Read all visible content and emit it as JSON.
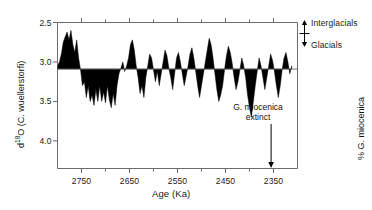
{
  "figure": {
    "axis_left_label_pre": "d",
    "axis_left_label_sup": "18",
    "axis_left_label_post": "O (C. wuellerstorfi)",
    "axis_left_label_full": "d18O (C. wuellerstorfi)",
    "axis_right_label": "% G. miocenica",
    "axis_x_label": "Age (Ka)",
    "annotation_interglacials": "Interglacials",
    "annotation_glacials": "Glacials",
    "annotation_extinct_line1": "G. miocenica",
    "annotation_extinct_line2": "extinct",
    "ink_color": "#000000",
    "axis_color": "#6b6b6b",
    "text_color": "#1a1a1a"
  },
  "chart_data": {
    "type": "area",
    "title": "",
    "xlabel": "Age (Ka)",
    "ylabel": "d18O (C. wuellerstorfi)",
    "y2label": "% G. miocenica",
    "xlim": [
      2800,
      2300
    ],
    "x_reversed": true,
    "xticks": [
      2750,
      2650,
      2550,
      2450,
      2350
    ],
    "xtick_labels": [
      "2750",
      "2650",
      "2550",
      "2450",
      "2350"
    ],
    "x_minor_ticks": [
      2800,
      2700,
      2600,
      2500,
      2400,
      2300
    ],
    "ylim_left": [
      4.35,
      2.5
    ],
    "y_left_inverted": true,
    "yticks_left": [
      2.5,
      3.0,
      3.5,
      4.0
    ],
    "ytick_labels_left": [
      "2.5",
      "3.0",
      "3.5",
      "4.0"
    ],
    "ylim_right": [
      0.0,
      0.47
    ],
    "yticks_right": [
      0.0,
      0.1,
      0.2,
      0.3,
      0.4
    ],
    "ytick_labels_right": [
      "0.0",
      "0.1",
      "0.2",
      "0.3",
      "0.4"
    ],
    "grid": false,
    "legend": "none",
    "annotations": [
      {
        "text": "Interglacials",
        "x": 2290,
        "y_left": 2.75,
        "arrow": "up"
      },
      {
        "text": "Glacials",
        "x": 2290,
        "y_left": 3.45,
        "arrow": "down"
      },
      {
        "text": "G. miocenica extinct",
        "x": 2355,
        "y_right": 0.22,
        "arrow": "down"
      }
    ],
    "series": [
      {
        "name": "d18O (C. wuellerstorfi)",
        "axis": "left",
        "fill_baseline": 3.09,
        "x": [
          2800,
          2796,
          2792,
          2788,
          2784,
          2780,
          2776,
          2772,
          2768,
          2764,
          2760,
          2756,
          2752,
          2748,
          2744,
          2740,
          2736,
          2732,
          2728,
          2724,
          2720,
          2716,
          2712,
          2708,
          2704,
          2700,
          2696,
          2692,
          2688,
          2684,
          2680,
          2676,
          2672,
          2668,
          2664,
          2660,
          2656,
          2652,
          2648,
          2644,
          2640,
          2636,
          2632,
          2628,
          2624,
          2620,
          2616,
          2612,
          2608,
          2604,
          2600,
          2596,
          2592,
          2588,
          2584,
          2580,
          2576,
          2572,
          2568,
          2564,
          2560,
          2556,
          2552,
          2548,
          2544,
          2540,
          2536,
          2532,
          2528,
          2524,
          2520,
          2516,
          2512,
          2508,
          2504,
          2500,
          2496,
          2492,
          2488,
          2484,
          2480,
          2476,
          2472,
          2468,
          2464,
          2460,
          2456,
          2452,
          2448,
          2444,
          2440,
          2436,
          2432,
          2428,
          2424,
          2420,
          2416,
          2412,
          2408,
          2404,
          2400,
          2396,
          2392,
          2388,
          2384,
          2380,
          2376,
          2372,
          2368,
          2364,
          2360,
          2356,
          2352,
          2348,
          2344,
          2340,
          2336,
          2332,
          2328,
          2324,
          2320,
          2316,
          2312
        ],
        "values": [
          3.05,
          3.0,
          2.9,
          2.75,
          2.68,
          2.62,
          2.72,
          2.6,
          2.78,
          2.88,
          2.72,
          2.95,
          3.1,
          3.3,
          3.25,
          3.45,
          3.3,
          3.5,
          3.42,
          3.55,
          3.35,
          3.5,
          3.3,
          3.5,
          3.38,
          3.52,
          3.3,
          3.48,
          3.58,
          3.4,
          3.55,
          3.3,
          3.15,
          3.08,
          3.0,
          3.12,
          3.05,
          2.95,
          2.78,
          2.72,
          2.85,
          3.05,
          3.2,
          3.4,
          3.3,
          3.45,
          3.2,
          3.05,
          2.9,
          2.95,
          3.1,
          3.25,
          3.12,
          3.3,
          3.15,
          3.0,
          2.85,
          2.92,
          3.08,
          3.2,
          3.35,
          3.15,
          2.95,
          2.88,
          3.0,
          3.15,
          3.3,
          3.18,
          3.05,
          2.9,
          2.82,
          2.95,
          3.12,
          3.3,
          3.45,
          3.3,
          3.15,
          3.0,
          2.85,
          2.7,
          2.78,
          2.95,
          3.15,
          3.35,
          3.5,
          3.42,
          3.3,
          3.1,
          2.92,
          2.8,
          2.88,
          3.02,
          3.2,
          3.35,
          3.25,
          3.1,
          2.95,
          3.05,
          3.2,
          3.42,
          3.58,
          3.7,
          3.5,
          3.3,
          3.12,
          2.95,
          3.05,
          3.2,
          3.35,
          3.2,
          3.05,
          2.9,
          2.98,
          3.12,
          3.3,
          3.45,
          3.3,
          3.1,
          2.95,
          2.88,
          3.0,
          3.15,
          3.05
        ]
      },
      {
        "name": "% G. miocenica",
        "axis": "right",
        "fill_baseline": 0.0,
        "x": [
          2800,
          2796,
          2792,
          2788,
          2784,
          2780,
          2776,
          2772,
          2768,
          2764,
          2760,
          2756,
          2752,
          2748,
          2744,
          2740,
          2736,
          2732,
          2728,
          2724,
          2720,
          2716,
          2712,
          2708,
          2704,
          2700,
          2696,
          2692,
          2688,
          2684,
          2680,
          2676,
          2672,
          2668,
          2664,
          2660,
          2656,
          2652,
          2648,
          2644,
          2640,
          2636,
          2632,
          2628,
          2624,
          2620,
          2616,
          2612,
          2608,
          2604,
          2600,
          2596,
          2592,
          2588,
          2584,
          2580,
          2576,
          2572,
          2568,
          2564,
          2560,
          2556,
          2552,
          2548,
          2544,
          2540,
          2536,
          2532,
          2528,
          2524,
          2520,
          2516,
          2512,
          2508,
          2504,
          2500,
          2496,
          2492,
          2488,
          2484,
          2480,
          2476,
          2472,
          2468,
          2464,
          2460,
          2456,
          2452,
          2448,
          2444,
          2440,
          2436,
          2432,
          2428,
          2424,
          2420,
          2416,
          2412,
          2408,
          2404,
          2400,
          2396,
          2392,
          2388,
          2384,
          2380,
          2376,
          2372,
          2368,
          2364,
          2360,
          2356,
          2352,
          2348,
          2344,
          2340,
          2336,
          2332,
          2328,
          2324,
          2320,
          2316,
          2312
        ],
        "values": [
          0.12,
          0.08,
          0.13,
          0.1,
          0.16,
          0.11,
          0.18,
          0.13,
          0.2,
          0.15,
          0.22,
          0.17,
          0.26,
          0.19,
          0.24,
          0.18,
          0.23,
          0.17,
          0.22,
          0.16,
          0.21,
          0.15,
          0.19,
          0.14,
          0.2,
          0.13,
          0.17,
          0.11,
          0.15,
          0.1,
          0.14,
          0.09,
          0.12,
          0.07,
          0.11,
          0.06,
          0.1,
          0.28,
          0.12,
          0.08,
          0.14,
          0.09,
          0.13,
          0.08,
          0.12,
          0.07,
          0.11,
          0.06,
          0.1,
          0.2,
          0.14,
          0.09,
          0.3,
          0.16,
          0.11,
          0.15,
          0.1,
          0.14,
          0.09,
          0.13,
          0.08,
          0.12,
          0.07,
          0.11,
          0.19,
          0.13,
          0.09,
          0.14,
          0.1,
          0.16,
          0.11,
          0.09,
          0.13,
          0.08,
          0.12,
          0.07,
          0.11,
          0.06,
          0.36,
          0.14,
          0.1,
          0.15,
          0.09,
          0.13,
          0.08,
          0.11,
          0.06,
          0.1,
          0.05,
          0.09,
          0.04,
          0.08,
          0.04,
          0.07,
          0.03,
          0.06,
          0.03,
          0.07,
          0.04,
          0.08,
          0.05,
          0.09,
          0.05,
          0.08,
          0.04,
          0.07,
          0.04,
          0.06,
          0.03,
          0.06,
          0.03,
          0.05,
          0.04,
          0.06,
          0.03,
          0.05,
          0.02,
          0.04,
          0.03,
          0.05,
          0.02,
          0.04,
          0.02
        ]
      }
    ]
  }
}
